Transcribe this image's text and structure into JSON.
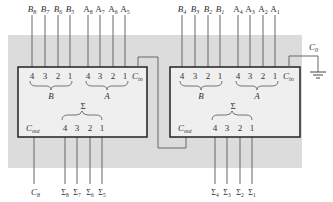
{
  "diagram": {
    "type": "cascaded 4-bit binary adders (8-bit adder)",
    "colors": {
      "panel": "#dcdcdc",
      "chip_fill": "#efefef",
      "line": "#555555",
      "chip_border": "#222222"
    },
    "left_chip": {
      "inputs_top": {
        "b_labels": [
          "B8",
          "B7",
          "B6",
          "B5"
        ],
        "a_labels": [
          "A8",
          "A7",
          "A6",
          "A5"
        ]
      },
      "pin_numbers_b": [
        "4",
        "3",
        "2",
        "1"
      ],
      "pin_numbers_a": [
        "4",
        "3",
        "2",
        "1"
      ],
      "group_b": "B",
      "group_a": "A",
      "cin": "C",
      "cin_sub": "in",
      "sum_group": "Σ",
      "sum_pins": [
        "4",
        "3",
        "2",
        "1"
      ],
      "cout": "C",
      "cout_sub": "out",
      "carry_out_label": "C",
      "carry_out_sub": "8",
      "sum_outputs": [
        "Σ8",
        "Σ7",
        "Σ6",
        "Σ5"
      ]
    },
    "right_chip": {
      "inputs_top": {
        "b_labels": [
          "B4",
          "B3",
          "B2",
          "B1"
        ],
        "a_labels": [
          "A4",
          "A3",
          "A2",
          "A1"
        ]
      },
      "pin_numbers_b": [
        "4",
        "3",
        "2",
        "1"
      ],
      "pin_numbers_a": [
        "4",
        "3",
        "2",
        "1"
      ],
      "group_b": "B",
      "group_a": "A",
      "cin": "C",
      "cin_sub": "in",
      "sum_group": "Σ",
      "sum_pins": [
        "4",
        "3",
        "2",
        "1"
      ],
      "cout": "C",
      "cout_sub": "out",
      "sum_outputs": [
        "Σ4",
        "Σ3",
        "Σ2",
        "Σ1"
      ]
    },
    "ground_input": {
      "label": "C",
      "sub": "0"
    }
  }
}
